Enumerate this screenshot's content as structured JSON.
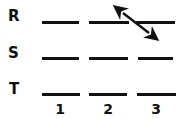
{
  "diagram": {
    "type": "energy-level-grid",
    "background_color": "#ffffff",
    "stroke_color": "#111111",
    "row_labels": [
      {
        "text": "R",
        "x": 8,
        "y": 11
      },
      {
        "text": "S",
        "x": 8,
        "y": 48
      },
      {
        "text": "T",
        "x": 9,
        "y": 84
      }
    ],
    "column_labels": [
      {
        "text": "1",
        "x": 51,
        "y": 104
      },
      {
        "text": "2",
        "x": 99,
        "y": 104
      },
      {
        "text": "3",
        "x": 147,
        "y": 104
      }
    ],
    "levels": [
      {
        "row": "R",
        "column": "1",
        "x": 42,
        "y": 21,
        "width": 37
      },
      {
        "row": "R",
        "column": "2",
        "x": 89,
        "y": 21,
        "width": 40
      },
      {
        "row": "R",
        "column": "3",
        "x": 136,
        "y": 21,
        "width": 39
      },
      {
        "row": "S",
        "column": "1",
        "x": 42,
        "y": 57,
        "width": 37
      },
      {
        "row": "S",
        "column": "2",
        "x": 89,
        "y": 57,
        "width": 39
      },
      {
        "row": "S",
        "column": "3",
        "x": 138,
        "y": 57,
        "width": 35
      },
      {
        "row": "T",
        "column": "1",
        "x": 42,
        "y": 93,
        "width": 38
      },
      {
        "row": "T",
        "column": "2",
        "x": 89,
        "y": 93,
        "width": 38
      },
      {
        "row": "T",
        "column": "3",
        "x": 137,
        "y": 93,
        "width": 39
      }
    ],
    "arrow": {
      "label": "double-headed diagonal arrow",
      "x1": 123,
      "y1": 13,
      "x2": 149,
      "y2": 33,
      "stroke_width": 2.4,
      "head_size": 7,
      "double_headed": true
    }
  }
}
